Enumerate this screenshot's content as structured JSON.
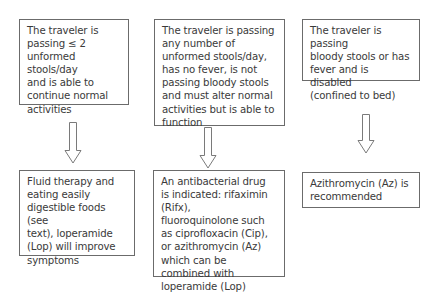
{
  "diagram": {
    "type": "flowchart",
    "boxes": {
      "condition_mild": "The traveler is\npassing ≤ 2\nunformed stools/day\nand is able to\ncontinue normal\nactivities",
      "condition_moderate": "The traveler is passing\nany number of\nunformed stools/day,\nhas no fever, is not\npassing bloody stools\nand must alter normal\nactivities but is able to\nfunction",
      "condition_severe": "The traveler is passing\nbloody stools or has\nfever and is disabled\n(confined to bed)",
      "treatment_mild": "Fluid therapy and\neating easily\ndigestible foods (see\ntext), loperamide\n(Lop) will improve\nsymptoms",
      "treatment_moderate": "An antibacterial drug\nis indicated: rifaximin (Rifx),\nfluoroquinolone such\nas ciprofloxacin (Cip),\nor azithromycin (Az)\nwhich can be\ncombined with\nloperamide (Lop)",
      "treatment_severe": "Azithromycin (Az) is\nrecommended"
    },
    "arrows": [
      {
        "from": "condition_mild",
        "to": "treatment_mild",
        "icon": "down-arrow-icon"
      },
      {
        "from": "condition_moderate",
        "to": "treatment_moderate",
        "icon": "down-arrow-icon"
      },
      {
        "from": "condition_severe",
        "to": "treatment_severe",
        "icon": "down-arrow-icon"
      }
    ],
    "colors": {
      "border": "#6b6b6b",
      "text": "#3a3a3a",
      "arrow": "#7a7a7a",
      "background": "#ffffff"
    }
  }
}
